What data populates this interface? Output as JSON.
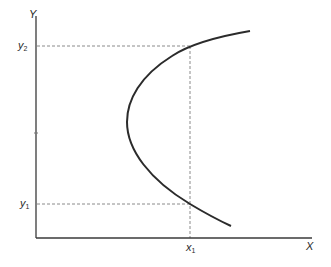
{
  "diagram": {
    "axes": {
      "y_label": "Y",
      "x_label": "X",
      "origin": [
        36,
        238
      ],
      "color": "#3a3a3a"
    },
    "curve": {
      "description": "parabola-like curve opening to the right",
      "color": "#2b2b2b",
      "start": [
        250,
        31
      ],
      "vertex": [
        127,
        122
      ],
      "end": [
        231,
        226
      ]
    },
    "guides": {
      "y2": {
        "label_base": "y",
        "label_sub": "2",
        "y": 46
      },
      "y1": {
        "label_base": "y",
        "label_sub": "1",
        "y": 204
      },
      "x1": {
        "label_base": "x",
        "label_sub": "1",
        "x": 190
      },
      "color": "#888888"
    }
  }
}
